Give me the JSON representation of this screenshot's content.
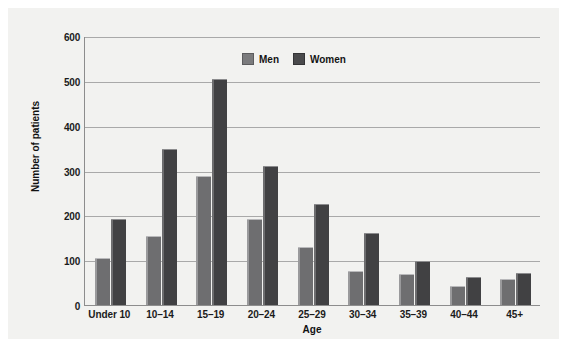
{
  "chart_data": {
    "type": "bar",
    "title": "",
    "xlabel": "Age",
    "ylabel": "Number of patients",
    "categories": [
      "Under 10",
      "10–14",
      "15–19",
      "20–24",
      "25–29",
      "30–34",
      "35–39",
      "40–44",
      "45+"
    ],
    "series": [
      {
        "name": "Men",
        "color": "#6e6e70",
        "values": [
          104,
          153,
          287,
          192,
          129,
          76,
          70,
          43,
          57
        ]
      },
      {
        "name": "Women",
        "color": "#414143",
        "values": [
          192,
          347,
          505,
          310,
          226,
          160,
          99,
          62,
          71
        ]
      }
    ],
    "ylim": [
      0,
      600
    ],
    "yticks": [
      0,
      100,
      200,
      300,
      400,
      500,
      600
    ],
    "ytick_labels": [
      "0",
      "100",
      "200",
      "300",
      "400",
      "500",
      "600"
    ],
    "grid": true,
    "legend_position": "top-center"
  },
  "legend": {
    "items": [
      {
        "label": "Men",
        "swatch": "men-swatch"
      },
      {
        "label": "Women",
        "swatch": "women-swatch"
      }
    ]
  }
}
